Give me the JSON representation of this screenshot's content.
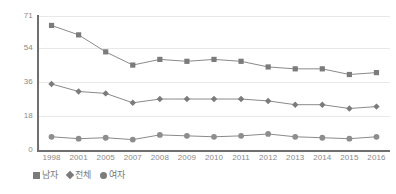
{
  "chart_data": {
    "type": "line",
    "title": "",
    "subtitle": "",
    "xlabel": "",
    "ylabel": "",
    "grid": true,
    "legend_position": "bottom-left",
    "categories": [
      "1998",
      "2001",
      "2005",
      "2007",
      "2008",
      "2009",
      "2010",
      "2011",
      "2012",
      "2013",
      "2014",
      "2015",
      "2016"
    ],
    "ylim": [
      0,
      71
    ],
    "yticks": [
      0,
      18,
      36,
      54,
      71
    ],
    "ytick_labels": [
      "0",
      "18",
      "36",
      "54",
      "71"
    ],
    "series": [
      {
        "name": "남자",
        "marker": "square",
        "color": "#7b7b7b",
        "values": [
          66,
          61,
          52,
          45,
          48,
          47,
          48,
          47,
          44,
          43,
          43,
          40,
          41
        ]
      },
      {
        "name": "전체",
        "marker": "diamond",
        "color": "#7b7b7b",
        "values": [
          35,
          31,
          30,
          25,
          27,
          27,
          27,
          27,
          26,
          24,
          24,
          22,
          23
        ]
      },
      {
        "name": "여자",
        "marker": "circle",
        "color": "#8d8d8d",
        "values": [
          7,
          6,
          6.5,
          5.5,
          8,
          7.5,
          7,
          7.5,
          8.5,
          7,
          6.5,
          6,
          7
        ]
      }
    ]
  },
  "legend": {
    "items": [
      {
        "label": "남자",
        "marker": "square"
      },
      {
        "label": "전체",
        "marker": "diamond"
      },
      {
        "label": "여자",
        "marker": "circle"
      }
    ]
  },
  "colors": {
    "line": "#8a8a8a",
    "marker": "#7b7b7b",
    "grid": "#e8e8e8",
    "axis": "#6f6f6f",
    "tick_text": "#8a8a8a",
    "legend_text": "#787878",
    "background": "#ffffff"
  }
}
